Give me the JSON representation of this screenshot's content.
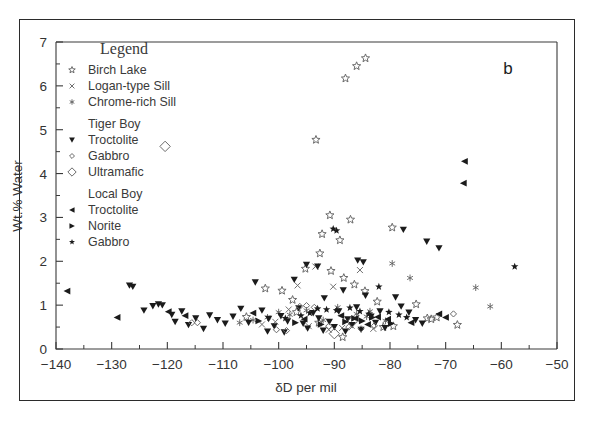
{
  "panel_label": "b",
  "chart_data": {
    "type": "scatter",
    "title": "",
    "xlabel": "δD per mil",
    "ylabel": "Wt.% Water",
    "xlim": [
      -140,
      -50
    ],
    "ylim": [
      0,
      7
    ],
    "xticks": [
      -140,
      -130,
      -120,
      -110,
      -100,
      -90,
      -80,
      -70,
      -60,
      -50
    ],
    "xticklabels": [
      "−140",
      "−130",
      "−120",
      "−110",
      "−100",
      "−90",
      "−80",
      "−70",
      "−60",
      "−50"
    ],
    "yticks": [
      0,
      1,
      2,
      3,
      4,
      5,
      6,
      7
    ],
    "yticklabels": [
      "0",
      "1",
      "2",
      "3",
      "4",
      "5",
      "6",
      "7"
    ],
    "x_minor_step": 5,
    "y_minor_step": 0.5,
    "grid": false,
    "legend_position": "upper-left-inside",
    "legend_title": "Legend",
    "series": [
      {
        "name": "Birch Lake",
        "marker": "star-open",
        "points": [
          [
            -86.0,
            6.45
          ],
          [
            -84.4,
            6.63
          ],
          [
            -88.0,
            6.17
          ],
          [
            -93.3,
            4.77
          ],
          [
            -90.8,
            3.05
          ],
          [
            -87.1,
            2.95
          ],
          [
            -92.2,
            2.62
          ],
          [
            -79.6,
            2.77
          ],
          [
            -89.0,
            2.48
          ],
          [
            -92.6,
            2.18
          ],
          [
            -95.2,
            1.83
          ],
          [
            -90.6,
            1.78
          ],
          [
            -88.3,
            1.62
          ],
          [
            -86.4,
            1.47
          ],
          [
            -84.5,
            1.32
          ],
          [
            -82.3,
            1.08
          ],
          [
            -97.5,
            1.12
          ],
          [
            -99.4,
            1.33
          ],
          [
            -102.4,
            1.38
          ],
          [
            -75.3,
            1.02
          ],
          [
            -71.6,
            0.72
          ],
          [
            -73.3,
            0.7
          ],
          [
            -72.6,
            0.68
          ],
          [
            -67.9,
            0.55
          ],
          [
            -79.4,
            0.52
          ],
          [
            -81.2,
            0.5
          ],
          [
            -88.5,
            0.27
          ],
          [
            -92.8,
            0.6
          ],
          [
            -96.8,
            0.84
          ],
          [
            -105.8,
            0.73
          ]
        ]
      },
      {
        "name": "Logan-type Sill",
        "marker": "x",
        "points": [
          [
            -93.4,
            1.88
          ],
          [
            -85.4,
            1.8
          ],
          [
            -96.6,
            1.45
          ],
          [
            -90.2,
            1.42
          ],
          [
            -98.2,
            0.9
          ],
          [
            -100.6,
            0.62
          ],
          [
            -94.6,
            0.52
          ],
          [
            -88.6,
            0.48
          ],
          [
            -86.9,
            0.53
          ],
          [
            -83.0,
            0.46
          ],
          [
            -103.0,
            0.56
          ],
          [
            -91.0,
            0.44
          ]
        ]
      },
      {
        "name": "Chrome-rich Sill",
        "marker": "asterisk",
        "points": [
          [
            -79.6,
            1.95
          ],
          [
            -76.4,
            1.62
          ],
          [
            -64.6,
            1.4
          ],
          [
            -62.0,
            0.97
          ],
          [
            -83.6,
            0.86
          ],
          [
            -86.0,
            0.8
          ],
          [
            -84.2,
            0.74
          ],
          [
            -89.4,
            0.95
          ],
          [
            -95.0,
            0.88
          ],
          [
            -98.0,
            0.78
          ],
          [
            -100.0,
            0.84
          ],
          [
            -102.0,
            0.72
          ],
          [
            -104.6,
            0.66
          ],
          [
            -107.0,
            0.6
          ],
          [
            -92.0,
            0.66
          ],
          [
            -80.8,
            0.64
          ]
        ]
      },
      {
        "name": "Tiger Boy Troctolite",
        "marker": "triangle-down",
        "points": [
          [
            -126.8,
            1.45
          ],
          [
            -126.2,
            1.42
          ],
          [
            -124.2,
            0.88
          ],
          [
            -122.6,
            0.98
          ],
          [
            -121.6,
            1.02
          ],
          [
            -120.9,
            1.0
          ],
          [
            -119.2,
            0.78
          ],
          [
            -118.6,
            0.62
          ],
          [
            -117.4,
            0.86
          ],
          [
            -116.2,
            0.55
          ],
          [
            -114.9,
            0.7
          ],
          [
            -113.5,
            0.46
          ],
          [
            -112.4,
            0.77
          ],
          [
            -111.0,
            0.66
          ],
          [
            -109.6,
            0.58
          ],
          [
            -108.2,
            0.74
          ],
          [
            -106.8,
            0.92
          ],
          [
            -105.4,
            0.6
          ],
          [
            -104.2,
            1.52
          ],
          [
            -103.0,
            0.88
          ],
          [
            -101.8,
            0.69
          ],
          [
            -100.8,
            0.52
          ],
          [
            -99.6,
            0.75
          ],
          [
            -98.4,
            0.63
          ],
          [
            -97.2,
            1.58
          ],
          [
            -96.4,
            0.93
          ],
          [
            -95.6,
            0.58
          ],
          [
            -94.8,
            0.47
          ],
          [
            -93.8,
            0.82
          ],
          [
            -92.8,
            0.7
          ],
          [
            -91.8,
            1.16
          ],
          [
            -90.9,
            0.62
          ],
          [
            -90.0,
            0.5
          ],
          [
            -89.2,
            0.86
          ],
          [
            -88.4,
            1.34
          ],
          [
            -87.6,
            0.68
          ],
          [
            -86.8,
            0.55
          ],
          [
            -86.0,
            0.95
          ],
          [
            -85.2,
            0.44
          ],
          [
            -84.4,
            1.22
          ],
          [
            -83.4,
            0.74
          ],
          [
            -82.6,
            0.6
          ],
          [
            -81.8,
            0.86
          ],
          [
            -80.9,
            0.48
          ],
          [
            -95.0,
            1.92
          ],
          [
            -93.0,
            1.88
          ],
          [
            -85.8,
            2.02
          ],
          [
            -84.8,
            1.98
          ],
          [
            -77.6,
            2.72
          ],
          [
            -73.4,
            2.45
          ],
          [
            -71.2,
            2.3
          ],
          [
            -79.0,
            1.18
          ],
          [
            -78.0,
            0.97
          ],
          [
            -76.6,
            0.83
          ],
          [
            -75.4,
            0.66
          ],
          [
            -74.2,
            0.58
          ],
          [
            -102.0,
            0.4
          ],
          [
            -99.0,
            0.38
          ],
          [
            -92.0,
            0.42
          ],
          [
            -88.0,
            0.4
          ]
        ]
      },
      {
        "name": "Tiger Boy Gabbro",
        "marker": "diamond-small",
        "points": [
          [
            -115.6,
            0.6
          ],
          [
            -114.6,
            0.6
          ],
          [
            -96.2,
            0.97
          ],
          [
            -95.0,
            0.99
          ],
          [
            -93.6,
            0.95
          ],
          [
            -91.0,
            0.52
          ],
          [
            -87.4,
            0.5
          ],
          [
            -85.2,
            0.46
          ],
          [
            -82.8,
            0.53
          ],
          [
            -68.6,
            0.8
          ],
          [
            -100.4,
            0.44
          ],
          [
            -98.6,
            0.42
          ]
        ]
      },
      {
        "name": "Tiger Boy Ultramafic",
        "marker": "diamond-large",
        "points": [
          [
            -120.4,
            4.62
          ],
          [
            -86.8,
            0.62
          ],
          [
            -90.0,
            0.35
          ]
        ]
      },
      {
        "name": "Local Boy Troctolite",
        "marker": "triangle-left",
        "points": [
          [
            -138.0,
            1.32
          ],
          [
            -129.0,
            0.72
          ],
          [
            -119.8,
            0.85
          ],
          [
            -116.8,
            0.76
          ],
          [
            -66.6,
            4.28
          ],
          [
            -66.8,
            3.78
          ],
          [
            -71.2,
            0.8
          ],
          [
            -70.0,
            0.72
          ],
          [
            -104.6,
            0.82
          ],
          [
            -82.2,
            0.73
          ],
          [
            -80.4,
            0.68
          ],
          [
            -86.2,
            0.7
          ],
          [
            -88.8,
            0.76
          ],
          [
            -95.4,
            0.68
          ],
          [
            -84.0,
            0.56
          ],
          [
            -76.2,
            0.6
          ]
        ]
      },
      {
        "name": "Local Boy Norite",
        "marker": "triangle-right",
        "points": [
          [
            -86.4,
            0.7
          ],
          [
            -85.0,
            0.64
          ],
          [
            -83.2,
            0.72
          ],
          [
            -88.0,
            0.62
          ],
          [
            -92.4,
            0.56
          ],
          [
            -79.8,
            0.58
          ],
          [
            -97.0,
            0.6
          ],
          [
            -103.6,
            0.64
          ]
        ]
      },
      {
        "name": "Local Boy Gabbro",
        "marker": "star-filled",
        "points": [
          [
            -82.0,
            1.42
          ],
          [
            -57.6,
            1.88
          ],
          [
            -93.0,
            0.92
          ],
          [
            -91.4,
            0.9
          ],
          [
            -89.6,
            0.88
          ],
          [
            -87.2,
            0.94
          ],
          [
            -85.4,
            0.86
          ],
          [
            -83.8,
            0.8
          ],
          [
            -80.2,
            0.84
          ],
          [
            -78.4,
            0.78
          ],
          [
            -77.0,
            0.72
          ],
          [
            -94.4,
            0.82
          ],
          [
            -96.0,
            0.76
          ],
          [
            -98.8,
            0.7
          ],
          [
            -90.2,
            2.74
          ],
          [
            -89.6,
            2.7
          ]
        ]
      }
    ]
  },
  "legend": {
    "title": "Legend",
    "entries": [
      {
        "label": "Birch Lake",
        "marker": "star-open",
        "group": null
      },
      {
        "label": "Logan-type Sill",
        "marker": "x",
        "group": null
      },
      {
        "label": "Chrome-rich Sill",
        "marker": "asterisk",
        "group": null
      },
      {
        "label": "Tiger Boy",
        "marker": null,
        "group": "header"
      },
      {
        "label": "Troctolite",
        "marker": "triangle-down",
        "group": "Tiger Boy"
      },
      {
        "label": "Gabbro",
        "marker": "diamond-small",
        "group": "Tiger Boy"
      },
      {
        "label": "Ultramafic",
        "marker": "diamond-large",
        "group": "Tiger Boy"
      },
      {
        "label": "Local Boy",
        "marker": null,
        "group": "header"
      },
      {
        "label": "Troctolite",
        "marker": "triangle-left",
        "group": "Local Boy"
      },
      {
        "label": "Norite",
        "marker": "triangle-right",
        "group": "Local Boy"
      },
      {
        "label": "Gabbro",
        "marker": "star-filled",
        "group": "Local Boy"
      }
    ]
  },
  "colors": {
    "frame": "#2b2b2b",
    "axis": "#3a3a3a",
    "filled_marker": "#1b1b1b",
    "open_marker": "#6a6a6a",
    "background": "#ffffff"
  }
}
